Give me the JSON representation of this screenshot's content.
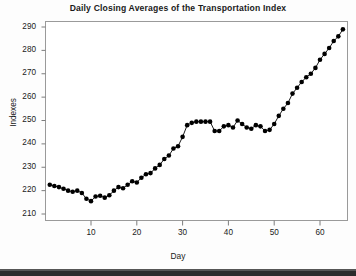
{
  "chart_data": {
    "type": "line",
    "title": "Daily Closing Averages of the Transportation Index",
    "xlabel": "Day",
    "ylabel": "Indexes",
    "xlim": [
      0,
      66
    ],
    "ylim": [
      205,
      293
    ],
    "xticks": [
      10,
      20,
      30,
      40,
      50,
      60
    ],
    "yticks": [
      210,
      220,
      230,
      240,
      250,
      260,
      270,
      280,
      290
    ],
    "grid": false,
    "legend": null,
    "marker": "filled-circle",
    "series_color": "#000000",
    "x": [
      1,
      2,
      3,
      4,
      5,
      6,
      7,
      8,
      9,
      10,
      11,
      12,
      13,
      14,
      15,
      16,
      17,
      18,
      19,
      20,
      21,
      22,
      23,
      24,
      25,
      26,
      27,
      28,
      29,
      30,
      31,
      32,
      33,
      34,
      35,
      36,
      37,
      38,
      39,
      40,
      41,
      42,
      43,
      44,
      45,
      46,
      47,
      48,
      49,
      50,
      51,
      52,
      53,
      54,
      55,
      56,
      57,
      58,
      59,
      60,
      61,
      62,
      63,
      64,
      65
    ],
    "values": [
      222.5,
      222.0,
      221.5,
      220.8,
      220.0,
      219.5,
      220.0,
      219.0,
      216.5,
      215.5,
      217.5,
      217.8,
      217.0,
      218.0,
      220.0,
      221.5,
      221.0,
      222.5,
      224.0,
      223.5,
      225.5,
      227.0,
      227.5,
      229.5,
      231.0,
      233.5,
      235.0,
      238.0,
      239.0,
      243.0,
      248.0,
      249.0,
      249.5,
      249.5,
      249.5,
      249.5,
      245.5,
      245.5,
      247.5,
      248.0,
      247.0,
      250.0,
      248.5,
      247.0,
      246.5,
      248.0,
      247.5,
      245.5,
      246.0,
      248.5,
      252.0,
      255.0,
      257.5,
      261.5,
      264.0,
      266.5,
      268.5,
      270.0,
      272.5,
      276.0,
      278.5,
      281.0,
      284.0,
      286.0,
      289.0
    ]
  },
  "axis": {
    "ytick_labels": [
      "290",
      "280",
      "270",
      "260",
      "250",
      "240",
      "230",
      "220",
      "210"
    ],
    "xtick_labels": [
      "10",
      "20",
      "30",
      "40",
      "50",
      "60"
    ]
  }
}
